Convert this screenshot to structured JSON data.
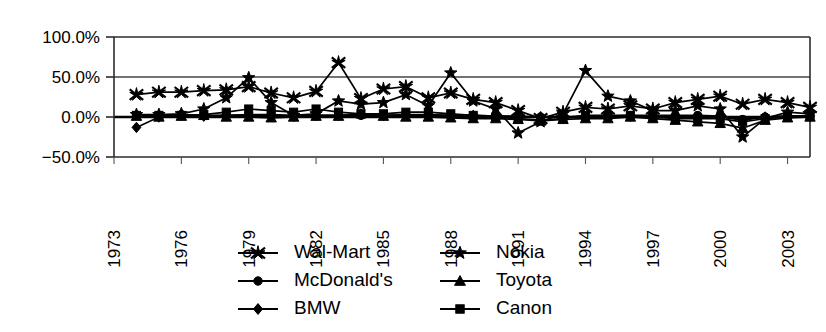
{
  "chart_data": {
    "type": "line",
    "title": "",
    "xlabel": "",
    "ylabel": "",
    "ylim": [
      -50,
      100
    ],
    "ytick_values": [
      100,
      50,
      0,
      -50
    ],
    "ytick_labels": [
      "100.0%",
      "50.0%",
      "0.0%",
      "−50.0%"
    ],
    "grid": true,
    "gridlines": [
      100,
      50,
      0,
      -50
    ],
    "legend_position": "bottom",
    "x_axis_range": [
      1973,
      2004
    ],
    "xtick_labels": [
      "1973",
      "1976",
      "1979",
      "1982",
      "1985",
      "1988",
      "1991",
      "1994",
      "1997",
      "2000",
      "2003"
    ],
    "xtick_values": [
      1973,
      1976,
      1979,
      1982,
      1985,
      1988,
      1991,
      1994,
      1997,
      2000,
      2003
    ],
    "x": [
      1974,
      1975,
      1976,
      1977,
      1978,
      1979,
      1980,
      1981,
      1982,
      1983,
      1984,
      1985,
      1986,
      1987,
      1988,
      1989,
      1990,
      1991,
      1992,
      1993,
      1994,
      1995,
      1996,
      1997,
      1998,
      1999,
      2000,
      2001,
      2002,
      2003,
      2004
    ],
    "series": [
      {
        "name": "Wal-Mart",
        "marker": "cross-star",
        "values": [
          28,
          31,
          31,
          33,
          34,
          38,
          30,
          24,
          32,
          68,
          23,
          35,
          38,
          24,
          30,
          22,
          18,
          8,
          -2,
          6,
          12,
          10,
          14,
          10,
          18,
          22,
          26,
          16,
          22,
          18,
          12
        ]
      },
      {
        "name": "McDonald's",
        "marker": "circle",
        "values": [
          2,
          2,
          3,
          2,
          2,
          3,
          3,
          2,
          2,
          2,
          2,
          2,
          2,
          2,
          2,
          2,
          1,
          1,
          0,
          0,
          1,
          1,
          2,
          2,
          2,
          2,
          1,
          -3,
          0,
          1,
          1
        ]
      },
      {
        "name": "BMW",
        "marker": "diamond",
        "values": [
          -13,
          0,
          2,
          1,
          2,
          2,
          2,
          1,
          2,
          2,
          3,
          2,
          3,
          3,
          2,
          2,
          1,
          0,
          0,
          0,
          1,
          1,
          1,
          1,
          1,
          1,
          0,
          -4,
          0,
          1,
          1
        ]
      },
      {
        "name": "Nokia",
        "marker": "star",
        "values": [
          3,
          3,
          4,
          10,
          24,
          49,
          18,
          2,
          4,
          20,
          16,
          18,
          28,
          14,
          55,
          20,
          10,
          -20,
          -6,
          4,
          58,
          26,
          20,
          8,
          8,
          14,
          10,
          -25,
          -2,
          6,
          4
        ]
      },
      {
        "name": "Toyota",
        "marker": "triangle",
        "values": [
          1,
          0,
          1,
          2,
          0,
          0,
          -1,
          0,
          1,
          1,
          4,
          1,
          0,
          0,
          -1,
          -2,
          -2,
          -3,
          -5,
          -3,
          -2,
          -2,
          0,
          -2,
          -4,
          -6,
          -8,
          -14,
          -4,
          -1,
          0
        ]
      },
      {
        "name": "Canon",
        "marker": "square",
        "values": [
          2,
          2,
          2,
          3,
          6,
          10,
          8,
          6,
          10,
          6,
          4,
          4,
          6,
          6,
          4,
          2,
          0,
          -2,
          -4,
          -2,
          2,
          2,
          2,
          0,
          -2,
          -2,
          -2,
          -6,
          -2,
          0,
          2
        ]
      }
    ]
  },
  "legend": {
    "items": [
      {
        "label": "Wal-Mart",
        "marker": "cross-star"
      },
      {
        "label": "McDonald's",
        "marker": "circle"
      },
      {
        "label": "BMW",
        "marker": "diamond"
      },
      {
        "label": "Nokia",
        "marker": "star"
      },
      {
        "label": "Toyota",
        "marker": "triangle"
      },
      {
        "label": "Canon",
        "marker": "square"
      }
    ]
  },
  "colors": {
    "ink": "#000000",
    "frame": "#2b2b2b",
    "grid": "#444444",
    "background": "#ffffff"
  }
}
